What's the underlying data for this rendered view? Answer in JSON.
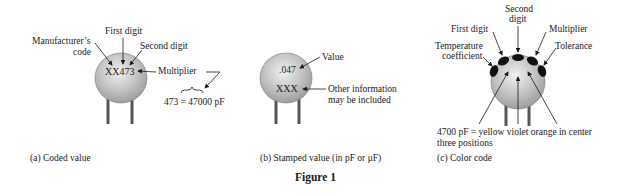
{
  "figure_title": "Figure 1",
  "panels": {
    "a": {
      "caption": "(a) Coded value",
      "body_marking": "XX473",
      "labels": {
        "manufacturer_line1": "Manufacturer’s",
        "manufacturer_line2": "code",
        "first_digit": "First digit",
        "second_digit": "Second digit",
        "multiplier": "Multiplier",
        "equation": "473 = 47000 pF"
      }
    },
    "b": {
      "caption": "(b) Stamped value (in pF or μF)",
      "body_value": ".047",
      "body_other": "XXX",
      "labels": {
        "value": "Value",
        "other_line1": "Other information",
        "other_line2": "may be included"
      }
    },
    "c": {
      "caption": "(c) Color code",
      "labels": {
        "second_digit_line1": "Second",
        "second_digit_line2": "digit",
        "first_digit": "First digit",
        "multiplier": "Multiplier",
        "temp_line1": "Temperature",
        "temp_line2": "coefficient",
        "tolerance": "Tolerance",
        "note_line1": "4700 pF = yellow violet orange in center",
        "note_line2": "three positions"
      }
    }
  },
  "colors": {
    "body_gray": "#b5b5b5",
    "band_black": "#111111",
    "line": "#1a1a1a"
  }
}
